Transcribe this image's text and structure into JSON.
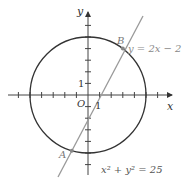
{
  "diagram": {
    "type": "coordinate-geometry",
    "axes": {
      "x_label": "x",
      "y_label": "y",
      "origin_label": "O",
      "x_unit_label": "1",
      "y_unit_label": "1",
      "x_ticks": [
        -6,
        -5,
        -4,
        -3,
        -2,
        -1,
        1,
        2,
        3,
        4,
        5,
        6
      ],
      "y_ticks": [
        -6,
        -5,
        -4,
        -3,
        -2,
        -1,
        1,
        2,
        3,
        4,
        5,
        6
      ]
    },
    "circle": {
      "equation_label": "x² + y² = 25",
      "center": [
        0,
        0
      ],
      "radius": 5,
      "color": "#333333"
    },
    "line": {
      "equation_label": "y = 2x − 2",
      "slope": 2,
      "intercept": -2,
      "color": "#999999"
    },
    "points": [
      {
        "label": "A",
        "coords": [
          -1.4,
          -4.8
        ]
      },
      {
        "label": "B",
        "coords": [
          3,
          4
        ]
      }
    ]
  }
}
